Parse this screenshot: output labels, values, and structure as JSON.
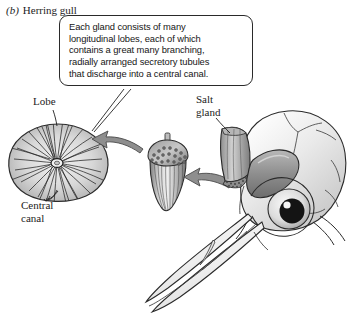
{
  "figure": {
    "panel_letter": "(b)",
    "panel_title": "Herring gull"
  },
  "callout": {
    "lines": [
      "Each gland consists of many",
      "longitudinal lobes, each of which",
      "contains a great many branching,",
      "radially arranged secretory tubules",
      "that discharge into a central canal."
    ],
    "text": "Each gland consists of many longitudinal lobes, each of which contains a great many branching, radially arranged secretory tubules that discharge into a central canal."
  },
  "labels": {
    "lobe": "Lobe",
    "central_canal_line1": "Central",
    "central_canal_line2": "canal",
    "salt_gland_line1": "Salt",
    "salt_gland_line2": "gland"
  },
  "illustration": {
    "lobe_cross_section": "radial-lobe-cross-section",
    "gland": "acorn-shaped-salt-gland",
    "skull": "gull-skull-lateral-view",
    "eye": "gull-eye",
    "beak": "gull-beak",
    "arrow_gland_to_lobe": "curved-arrow-left",
    "arrow_skull_to_gland": "curved-arrow-left",
    "callout_pointer": "callout-tail-line"
  },
  "colors": {
    "ink": "#1c1c1c",
    "outline": "#2a2a2a",
    "arrow_fill": "#8e8e8e",
    "arrow_stroke": "#4a4a4a",
    "gland_light": "#e2e2e2",
    "gland_mid": "#b4b4b4",
    "gland_dark": "#6f6f6f",
    "skull_light": "#f2f2f2",
    "skull_shadow": "#c9c9c9",
    "pupil": "#141414",
    "paper": "#ffffff"
  }
}
